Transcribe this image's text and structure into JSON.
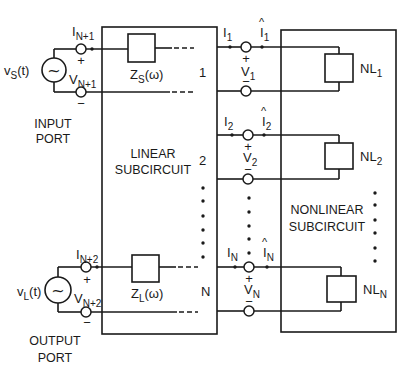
{
  "input_port": {
    "label_line1": "INPUT",
    "label_line2": "PORT",
    "source": {
      "symbol": "v",
      "sub": "S",
      "arg": "(t)",
      "glyph": "~"
    },
    "current": {
      "symbol": "I",
      "sub": "N+1"
    },
    "voltage": {
      "symbol": "V",
      "sub": "N+1"
    },
    "plus": "+",
    "minus": "−",
    "impedance": {
      "symbol": "Z",
      "sub": "S",
      "arg": "(ω)"
    }
  },
  "output_port": {
    "label_line1": "OUTPUT",
    "label_line2": "PORT",
    "source": {
      "symbol": "v",
      "sub": "L",
      "arg": "(t)",
      "glyph": "~"
    },
    "current": {
      "symbol": "I",
      "sub": "N+2"
    },
    "voltage": {
      "symbol": "V",
      "sub": "N+2"
    },
    "plus": "+",
    "minus": "−",
    "impedance": {
      "symbol": "Z",
      "sub": "L",
      "arg": "(ω)"
    }
  },
  "linear_subcircuit": {
    "label_line1": "LINEAR",
    "label_line2": "SUBCIRCUIT",
    "port_numbers": [
      "1",
      "2",
      "N"
    ]
  },
  "nonlinear_subcircuit": {
    "label_line1": "NONLINEAR",
    "label_line2": "SUBCIRCUIT"
  },
  "ports": [
    {
      "current": {
        "symbol": "I",
        "sub": "1"
      },
      "current_hat": {
        "symbol": "I",
        "sub": "1",
        "hat": "^"
      },
      "voltage": {
        "symbol": "V",
        "sub": "1"
      },
      "plus": "+",
      "minus": "−",
      "element": {
        "symbol": "NL",
        "sub": "1"
      }
    },
    {
      "current": {
        "symbol": "I",
        "sub": "2"
      },
      "current_hat": {
        "symbol": "I",
        "sub": "2",
        "hat": "^"
      },
      "voltage": {
        "symbol": "V",
        "sub": "2"
      },
      "plus": "+",
      "minus": "−",
      "element": {
        "symbol": "NL",
        "sub": "2"
      }
    },
    {
      "current": {
        "symbol": "I",
        "sub": "N"
      },
      "current_hat": {
        "symbol": "I",
        "sub": "N",
        "hat": "^"
      },
      "voltage": {
        "symbol": "V",
        "sub": "N"
      },
      "plus": "+",
      "minus": "−",
      "element": {
        "symbol": "NL",
        "sub": "N"
      }
    }
  ],
  "colors": {
    "line": "#1a1a1a",
    "background": "#ffffff"
  }
}
